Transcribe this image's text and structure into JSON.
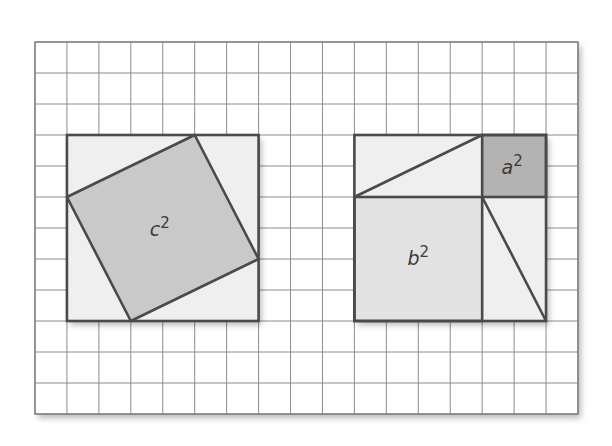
{
  "figure": {
    "grid": {
      "columns": 17,
      "rows": 12,
      "left": 35,
      "top": 42,
      "cell_width": 31.94,
      "cell_height": 31.0,
      "line_color": "#8c8c8c",
      "border_color": "#7a7a7a"
    },
    "colors": {
      "outline": "#4a4a4a",
      "triangle_fill": "#efefef",
      "c_square_fill": "#c9c9c9",
      "b_square_fill": "#e2e2e2",
      "a_square_fill": "#b3b3b3",
      "label_color": "#3a3a3a"
    },
    "left_panel": {
      "outer_square": {
        "col": 1,
        "row": 3,
        "size": 6
      },
      "tilted_square_vertices": [
        [
          5,
          3
        ],
        [
          7,
          7
        ],
        [
          3,
          9
        ],
        [
          1,
          5
        ]
      ],
      "label": {
        "base": "c",
        "exponent": "2"
      }
    },
    "right_panel": {
      "outer_square": {
        "col": 10,
        "row": 3,
        "size": 6
      },
      "a_square": {
        "col": 14,
        "row": 3,
        "size": 2,
        "label": {
          "base": "a",
          "exponent": "2"
        }
      },
      "b_square": {
        "col": 10,
        "row": 5,
        "size": 4,
        "label": {
          "base": "b",
          "exponent": "2"
        }
      },
      "top_rectangle_diagonal": [
        [
          10,
          5
        ],
        [
          14,
          3
        ]
      ],
      "side_rectangle_diagonal": [
        [
          14,
          5
        ],
        [
          16,
          9
        ]
      ]
    },
    "legs": {
      "a": 2,
      "b": 4
    }
  }
}
